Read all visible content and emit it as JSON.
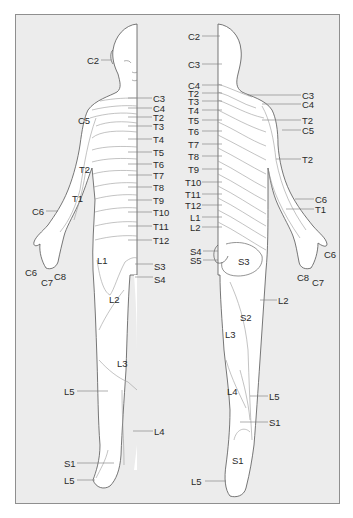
{
  "figure": {
    "views": [
      "anterior",
      "posterior"
    ],
    "colors": {
      "background": "#ececec",
      "skin": "#ffffff",
      "outline": "#555555",
      "dermatome_line": "#9a9a9a",
      "label": "#2a2a2a",
      "border": "#8f8f8f"
    }
  },
  "anterior_labels": [
    {
      "text": "C2",
      "x": 87,
      "y": 56
    },
    {
      "text": "C3",
      "x": 153,
      "y": 94
    },
    {
      "text": "C4",
      "x": 153,
      "y": 104
    },
    {
      "text": "T2",
      "x": 153,
      "y": 113
    },
    {
      "text": "C5",
      "x": 78,
      "y": 116
    },
    {
      "text": "T3",
      "x": 153,
      "y": 122
    },
    {
      "text": "T4",
      "x": 153,
      "y": 135
    },
    {
      "text": "T5",
      "x": 153,
      "y": 148
    },
    {
      "text": "T6",
      "x": 153,
      "y": 160
    },
    {
      "text": "T2",
      "x": 79,
      "y": 165
    },
    {
      "text": "T7",
      "x": 153,
      "y": 171
    },
    {
      "text": "T8",
      "x": 153,
      "y": 183
    },
    {
      "text": "T1",
      "x": 72,
      "y": 194
    },
    {
      "text": "T9",
      "x": 153,
      "y": 196
    },
    {
      "text": "C6",
      "x": 32,
      "y": 207
    },
    {
      "text": "T10",
      "x": 153,
      "y": 208
    },
    {
      "text": "T11",
      "x": 153,
      "y": 222
    },
    {
      "text": "T12",
      "x": 153,
      "y": 236
    },
    {
      "text": "L1",
      "x": 97,
      "y": 256
    },
    {
      "text": "C6",
      "x": 25,
      "y": 268
    },
    {
      "text": "C8",
      "x": 54,
      "y": 272
    },
    {
      "text": "S3",
      "x": 154,
      "y": 262
    },
    {
      "text": "S4",
      "x": 154,
      "y": 275
    },
    {
      "text": "C7",
      "x": 41,
      "y": 278
    },
    {
      "text": "L2",
      "x": 109,
      "y": 295
    },
    {
      "text": "L3",
      "x": 117,
      "y": 359
    },
    {
      "text": "L5",
      "x": 64,
      "y": 387
    },
    {
      "text": "L4",
      "x": 154,
      "y": 427
    },
    {
      "text": "S1",
      "x": 64,
      "y": 459
    },
    {
      "text": "L5",
      "x": 64,
      "y": 476
    }
  ],
  "posterior_labels": [
    {
      "text": "C2",
      "x": 188,
      "y": 32
    },
    {
      "text": "C3",
      "x": 188,
      "y": 60
    },
    {
      "text": "C4",
      "x": 188,
      "y": 81
    },
    {
      "text": "T2",
      "x": 188,
      "y": 89
    },
    {
      "text": "C3",
      "x": 302,
      "y": 91
    },
    {
      "text": "T3",
      "x": 188,
      "y": 97
    },
    {
      "text": "C4",
      "x": 302,
      "y": 100
    },
    {
      "text": "T4",
      "x": 188,
      "y": 106
    },
    {
      "text": "T5",
      "x": 188,
      "y": 116
    },
    {
      "text": "T2",
      "x": 302,
      "y": 116
    },
    {
      "text": "T6",
      "x": 188,
      "y": 127
    },
    {
      "text": "C5",
      "x": 302,
      "y": 126
    },
    {
      "text": "T7",
      "x": 188,
      "y": 140
    },
    {
      "text": "T8",
      "x": 188,
      "y": 152
    },
    {
      "text": "T2",
      "x": 302,
      "y": 155
    },
    {
      "text": "T9",
      "x": 188,
      "y": 165
    },
    {
      "text": "T10",
      "x": 185,
      "y": 178
    },
    {
      "text": "T11",
      "x": 185,
      "y": 190
    },
    {
      "text": "T12",
      "x": 185,
      "y": 201
    },
    {
      "text": "C6",
      "x": 315,
      "y": 195
    },
    {
      "text": "T1",
      "x": 315,
      "y": 205
    },
    {
      "text": "L1",
      "x": 190,
      "y": 213
    },
    {
      "text": "L2",
      "x": 190,
      "y": 223
    },
    {
      "text": "S4",
      "x": 190,
      "y": 247
    },
    {
      "text": "S3",
      "x": 238,
      "y": 257
    },
    {
      "text": "C6",
      "x": 324,
      "y": 250
    },
    {
      "text": "S5",
      "x": 190,
      "y": 256
    },
    {
      "text": "C8",
      "x": 297,
      "y": 273
    },
    {
      "text": "C7",
      "x": 312,
      "y": 278
    },
    {
      "text": "L2",
      "x": 278,
      "y": 296
    },
    {
      "text": "S2",
      "x": 240,
      "y": 313
    },
    {
      "text": "L3",
      "x": 225,
      "y": 330
    },
    {
      "text": "L4",
      "x": 227,
      "y": 387
    },
    {
      "text": "L5",
      "x": 269,
      "y": 392
    },
    {
      "text": "S1",
      "x": 269,
      "y": 418
    },
    {
      "text": "S1",
      "x": 232,
      "y": 456
    },
    {
      "text": "L5",
      "x": 191,
      "y": 477
    }
  ]
}
